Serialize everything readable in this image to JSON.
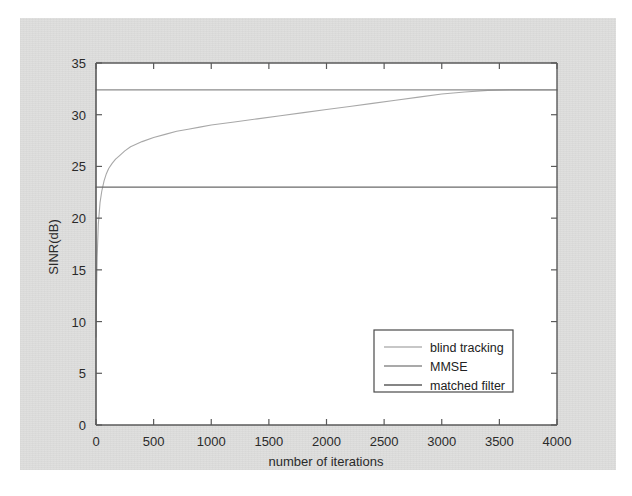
{
  "figure": {
    "background_color": "#dededd",
    "plot_background_color": "#ffffff",
    "axis_color": "#555555"
  },
  "chart_data": {
    "type": "line",
    "title": "",
    "xlabel": "number of iterations",
    "ylabel": "SINR(dB)",
    "xlim": [
      0,
      4000
    ],
    "ylim": [
      0,
      35
    ],
    "xticks": [
      0,
      500,
      1000,
      1500,
      2000,
      2500,
      3000,
      3500,
      4000
    ],
    "xtick_labels": [
      "0",
      "500",
      "1000",
      "1500",
      "2000",
      "2500",
      "3000",
      "3500",
      "4000"
    ],
    "yticks": [
      0,
      5,
      10,
      15,
      20,
      25,
      30,
      35
    ],
    "ytick_labels": [
      "0",
      "5",
      "10",
      "15",
      "20",
      "25",
      "30",
      "35"
    ],
    "grid": false,
    "legend_position": "lower right",
    "series": [
      {
        "name": "blind tracking",
        "color": "#a8a8a8",
        "line_width": 1.1,
        "x": [
          0,
          5,
          10,
          20,
          35,
          50,
          70,
          90,
          110,
          140,
          170,
          200,
          250,
          300,
          400,
          500,
          600,
          700,
          800,
          900,
          1000,
          1200,
          1400,
          1600,
          1800,
          2000,
          2200,
          2400,
          2600,
          2800,
          3000,
          3200,
          3400,
          3600,
          3800,
          4000
        ],
        "y": [
          8.5,
          13.0,
          16.2,
          19.4,
          21.5,
          22.6,
          23.6,
          24.3,
          24.8,
          25.3,
          25.7,
          26.0,
          26.5,
          26.9,
          27.4,
          27.8,
          28.1,
          28.4,
          28.6,
          28.8,
          29.0,
          29.3,
          29.6,
          29.9,
          30.2,
          30.5,
          30.8,
          31.1,
          31.4,
          31.7,
          32.0,
          32.2,
          32.35,
          32.4,
          32.4,
          32.4
        ]
      },
      {
        "name": "MMSE",
        "color": "#8c8c8c",
        "line_width": 1.3,
        "constant_value": 32.4,
        "x": [
          0,
          4000
        ],
        "y": [
          32.4,
          32.4
        ]
      },
      {
        "name": "matched filter",
        "color": "#6a6a6a",
        "line_width": 1.3,
        "constant_value": 23.0,
        "x": [
          0,
          4000
        ],
        "y": [
          23.0,
          23.0
        ]
      }
    ],
    "legend_entries": [
      {
        "label": "blind tracking",
        "color": "#b4b4b4"
      },
      {
        "label": "MMSE",
        "color": "#8c8c8c"
      },
      {
        "label": "matched filter",
        "color": "#5c5c5c"
      }
    ]
  }
}
